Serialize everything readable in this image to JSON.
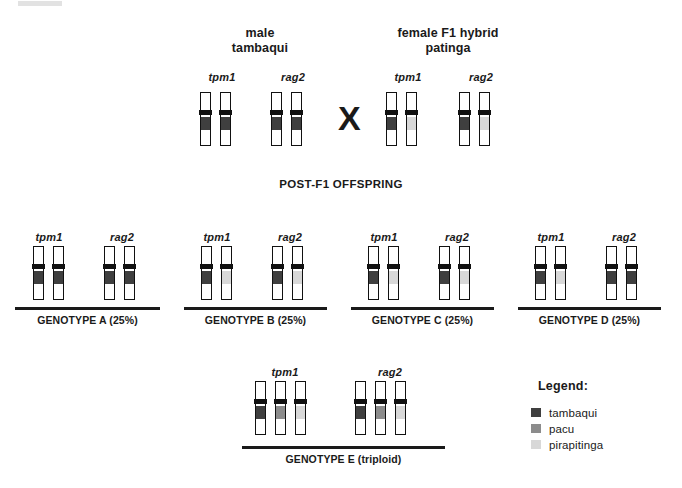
{
  "colors": {
    "tambaqui": "#3f3f3f",
    "pacu": "#8c8c8c",
    "pirapitinga": "#d8d8d8",
    "outline": "#111111",
    "text": "#1a1a1a"
  },
  "artifact": {
    "name": "scan-artifact"
  },
  "parents": {
    "cross_symbol": "X",
    "male": {
      "title_line1": "male",
      "title_line2": "tambaqui",
      "genes": [
        {
          "label": "tpm1",
          "alleles": [
            "tambaqui",
            "tambaqui"
          ]
        },
        {
          "label": "rag2",
          "alleles": [
            "tambaqui",
            "tambaqui"
          ]
        }
      ]
    },
    "female": {
      "title_line1": "female F1 hybrid",
      "title_line2": "patinga",
      "genes": [
        {
          "label": "tpm1",
          "alleles": [
            "tambaqui",
            "pirapitinga"
          ]
        },
        {
          "label": "rag2",
          "alleles": [
            "tambaqui",
            "pirapitinga"
          ]
        }
      ]
    }
  },
  "offspring": {
    "section_title": "POST-F1 OFFSPRING",
    "genotypes": [
      {
        "label": "GENOTYPE A (25%)",
        "genes": [
          {
            "label": "tpm1",
            "alleles": [
              "tambaqui",
              "tambaqui"
            ]
          },
          {
            "label": "rag2",
            "alleles": [
              "tambaqui",
              "tambaqui"
            ]
          }
        ]
      },
      {
        "label": "GENOTYPE B (25%)",
        "genes": [
          {
            "label": "tpm1",
            "alleles": [
              "tambaqui",
              "pirapitinga"
            ]
          },
          {
            "label": "rag2",
            "alleles": [
              "tambaqui",
              "pirapitinga"
            ]
          }
        ]
      },
      {
        "label": "GENOTYPE C (25%)",
        "genes": [
          {
            "label": "tpm1",
            "alleles": [
              "tambaqui",
              "pirapitinga"
            ]
          },
          {
            "label": "rag2",
            "alleles": [
              "tambaqui",
              "pirapitinga"
            ]
          }
        ]
      },
      {
        "label": "GENOTYPE D (25%)",
        "genes": [
          {
            "label": "tpm1",
            "alleles": [
              "tambaqui",
              "pirapitinga"
            ]
          },
          {
            "label": "rag2",
            "alleles": [
              "tambaqui",
              "tambaqui"
            ]
          }
        ]
      }
    ],
    "triploid": {
      "label": "GENOTYPE E (triploid)",
      "genes": [
        {
          "label": "tpm1",
          "alleles": [
            "tambaqui",
            "pacu",
            "pirapitinga"
          ]
        },
        {
          "label": "rag2",
          "alleles": [
            "tambaqui",
            "pacu",
            "pirapitinga"
          ]
        }
      ]
    }
  },
  "legend": {
    "title": "Legend:",
    "items": [
      {
        "name": "tambaqui",
        "color_key": "tambaqui"
      },
      {
        "name": "pacu",
        "color_key": "pacu"
      },
      {
        "name": "pirapitinga",
        "color_key": "pirapitinga"
      }
    ]
  }
}
